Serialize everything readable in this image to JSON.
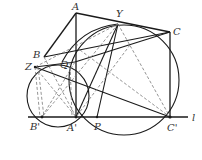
{
  "figure": {
    "type": "geometry-diagram",
    "line_label": "l",
    "points": {
      "A": {
        "label": "A",
        "x": 76,
        "y": 13
      },
      "Y": {
        "label": "Y",
        "x": 118,
        "y": 24
      },
      "C": {
        "label": "C",
        "x": 170,
        "y": 32
      },
      "B": {
        "label": "B",
        "x": 44,
        "y": 57
      },
      "Z": {
        "label": "Z",
        "x": 35,
        "y": 67
      },
      "Q": {
        "label": "Q",
        "x": 75,
        "y": 62
      },
      "B'": {
        "label": "B'",
        "x": 42,
        "y": 117
      },
      "A'": {
        "label": "A'",
        "x": 76,
        "y": 117
      },
      "P": {
        "label": "P",
        "x": 97,
        "y": 117
      },
      "C'": {
        "label": "C'",
        "x": 170,
        "y": 117
      }
    },
    "labels": {
      "A": "A",
      "Y": "Y",
      "C": "C",
      "B": "B",
      "Z": "Z",
      "Q": "Q",
      "Bp": "B'",
      "Ap": "A'",
      "P": "P",
      "Cp": "C'",
      "l": "l"
    },
    "colors": {
      "line": "#1a1a1a",
      "dashed": "#7a7a7a",
      "label": "#333333",
      "background": "#ffffff"
    }
  }
}
